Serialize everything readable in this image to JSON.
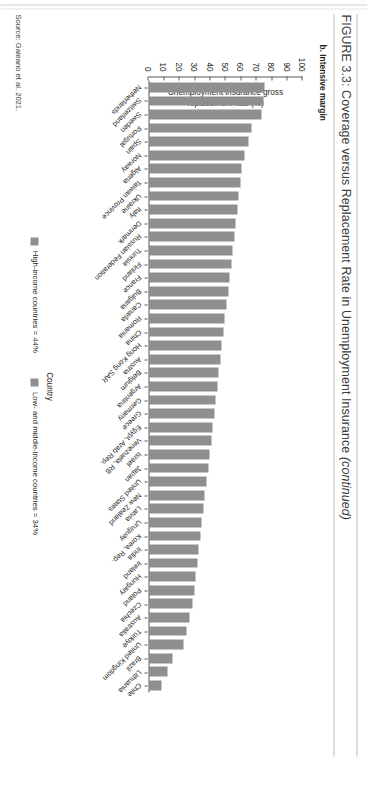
{
  "figure": {
    "label": "FIGURE 3.3:",
    "title_main": "Coverage versus Replacement Rate in Unemployment Insurance ",
    "title_italic": "(continued)",
    "panel_subtitle": "b. Intensive margin",
    "source": "Source: Galeano et al. 2021."
  },
  "legend": {
    "items": [
      {
        "label": "High-income countries = 44%",
        "color": "#8f8f8f"
      },
      {
        "label": "Low- and middle-income countries = 34%",
        "color": "#8f8f8f"
      }
    ]
  },
  "chart_data": {
    "type": "bar",
    "title": "b. Intensive margin",
    "xlabel": "Country",
    "ylabel": "Unemployment insurance gross replacement rate (%)",
    "ylim": [
      0,
      100
    ],
    "yticks": [
      0,
      10,
      20,
      30,
      40,
      50,
      60,
      70,
      80,
      90,
      100
    ],
    "grid": false,
    "legend_position": "bottom",
    "bar_color": "#8f8f8f",
    "orientation": "vertical",
    "categories": [
      "Netherlands",
      "Switzerland",
      "Sweden",
      "Portugal",
      "Spain",
      "Norway",
      "Algeria",
      "Taiwan Province",
      "Ukraine",
      "Italy",
      "Denmark",
      "Russian Federation",
      "Tunisia",
      "Finland",
      "France",
      "Bulgaria",
      "Canada",
      "Romania",
      "China",
      "Hong Kong SAR",
      "Austria",
      "Belgium",
      "Argentina",
      "Germany",
      "Greece",
      "Egypt, Arab Rep.",
      "Venezuela, RB",
      "Israel",
      "Japan",
      "United States",
      "New Zealand",
      "Latvia",
      "Uruguay",
      "Korea, Rep.",
      "India",
      "Ireland",
      "Hungary",
      "Poland",
      "Czechia",
      "Australia",
      "Türkiye",
      "United Kingdom",
      "Brazil",
      "Lithuania",
      "Chile"
    ],
    "values": [
      75,
      74,
      73,
      66,
      64,
      62,
      60,
      59,
      58,
      57,
      56,
      55,
      54,
      53,
      52,
      51,
      50,
      49,
      48,
      47,
      46,
      45,
      44,
      43,
      42,
      41,
      40,
      39,
      38,
      37,
      36,
      35,
      34,
      33,
      32,
      31,
      30,
      29,
      28,
      26,
      24,
      22,
      15,
      12,
      8
    ]
  }
}
